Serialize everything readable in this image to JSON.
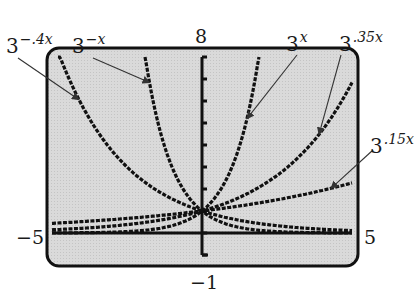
{
  "chart_data": {
    "type": "line",
    "title": "",
    "xlabel": "",
    "ylabel": "",
    "xlim": [
      -5,
      5
    ],
    "ylim": [
      -1,
      8
    ],
    "window_labels": {
      "xmin": "−5",
      "xmax": "5",
      "ymin": "−1",
      "ymax": "8"
    },
    "grid": false,
    "y_ticks_every": 1,
    "series": [
      {
        "name": "3^(-.4x)",
        "base": "3",
        "exponent": "−.4x",
        "k": -0.4
      },
      {
        "name": "3^(-x)",
        "base": "3",
        "exponent": "−x",
        "k": -1
      },
      {
        "name": "3^x",
        "base": "3",
        "exponent": "x",
        "k": 1
      },
      {
        "name": "3^(.35x)",
        "base": "3",
        "exponent": ".35x",
        "k": 0.35
      },
      {
        "name": "3^(.15x)",
        "base": "3",
        "exponent": ".15x",
        "k": 0.15
      }
    ],
    "annotations": "Arrows point from each label to its curve on a graphing calculator screen; all curves pass through (0,1)"
  },
  "colors": {
    "screen_bg": "#d9d9d9",
    "frame": "#111111",
    "curve": "#111111",
    "arrow": "#333333"
  }
}
